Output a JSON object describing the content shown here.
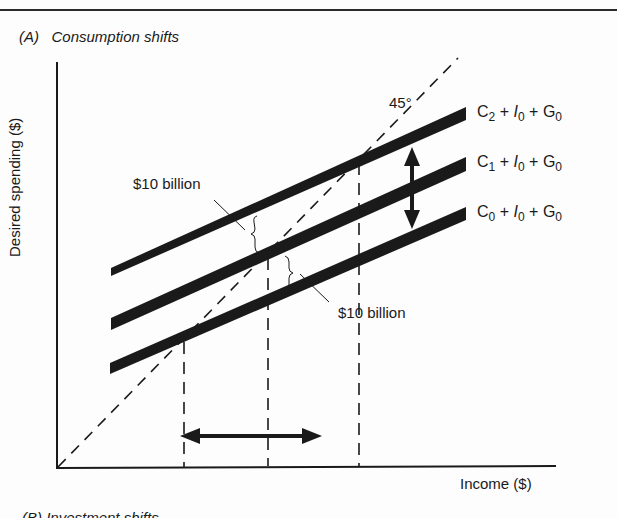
{
  "page": {
    "panel_title": "(A)   Consumption shifts",
    "next_panel_title": "(B)   Investment shifts",
    "y_axis_label": "Desired spending ($)",
    "x_axis_label": "Income ($)",
    "angle_label": "45°",
    "annotation_upper": "$10 billion",
    "annotation_lower": "$10 billion"
  },
  "curves": [
    {
      "id": "C2",
      "C": "C",
      "c_sub": "2",
      "I": "I",
      "i_sub": "0",
      "G": "G",
      "g_sub": "0",
      "plus": "+"
    },
    {
      "id": "C1",
      "C": "C",
      "c_sub": "1",
      "I": "I",
      "i_sub": "0",
      "G": "G",
      "g_sub": "0",
      "plus": "+"
    },
    {
      "id": "C0",
      "C": "C",
      "c_sub": "0",
      "I": "I",
      "i_sub": "0",
      "G": "G",
      "g_sub": "0",
      "plus": "+"
    }
  ],
  "colors": {
    "ink": "#1a1a1a",
    "background": "#fdfdfd"
  }
}
